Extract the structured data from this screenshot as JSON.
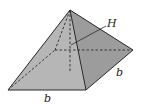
{
  "diagram": {
    "type": "square-pyramid",
    "labels": {
      "height": "H",
      "base_front": "b",
      "base_side": "b"
    },
    "colors": {
      "face_left": "#a9a9a9",
      "face_front": "#b4b4b4",
      "face_right": "#9a9a9a",
      "edge": "#2a2a2a",
      "background": "#ffffff"
    }
  }
}
